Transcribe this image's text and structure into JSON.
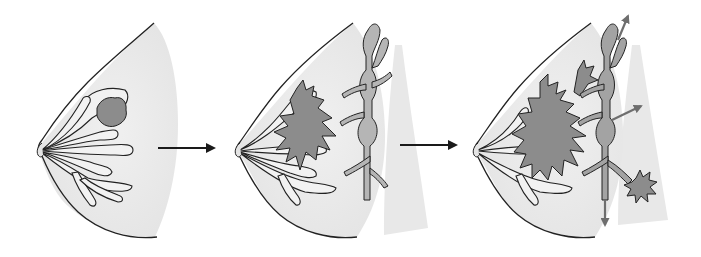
{
  "diagram": {
    "type": "medical-illustration",
    "subject": "breast cancer progression",
    "panels": [
      {
        "id": "stage-1",
        "description": "Breast with lobules and ducts; small localized tumor within one lobule"
      },
      {
        "id": "stage-2",
        "description": "Tumor grown and invading ducts; adjacent lymphatic vessel with nodes"
      },
      {
        "id": "stage-3",
        "description": "Tumor spread into lymphatic vessels and nodes, with arrows indicating metastasis and a secondary tumor"
      }
    ],
    "arrows": [
      {
        "from": "stage-1",
        "to": "stage-2"
      },
      {
        "from": "stage-2",
        "to": "stage-3"
      }
    ],
    "text_labels": []
  },
  "colors": {
    "background": "#ffffff",
    "tissue": "#ebebeb",
    "chest_wall": "#e6e6e6",
    "outline": "#222222",
    "tumor": "#8c8c8c",
    "lymph_vessel": "#b5b5b5",
    "lymph_infected": "#a3a3a3",
    "arrow": "#1a1a1a",
    "spread_arrow": "#6e6e6e"
  }
}
